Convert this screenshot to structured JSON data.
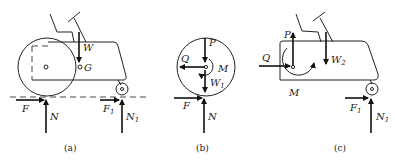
{
  "figure": {
    "panels": [
      {
        "id": "a",
        "caption": "(a)",
        "labels": {
          "weight": "W",
          "center_of_gravity": "G",
          "friction_rear": "F",
          "normal_rear": "N",
          "friction_front": "F",
          "friction_front_sub": "1",
          "normal_front": "N",
          "normal_front_sub": "1"
        }
      },
      {
        "id": "b",
        "caption": "(b)",
        "labels": {
          "force_p": "P",
          "force_q": "Q",
          "moment": "M",
          "weight_wheel": "W",
          "weight_wheel_sub": "1",
          "friction": "F",
          "normal": "N"
        }
      },
      {
        "id": "c",
        "caption": "(c)",
        "labels": {
          "force_p": "P",
          "force_q": "Q",
          "moment": "M",
          "weight_frame": "W",
          "weight_frame_sub": "2",
          "friction_front": "F",
          "friction_front_sub": "1",
          "normal_front": "N",
          "normal_front_sub": "1"
        }
      }
    ]
  }
}
